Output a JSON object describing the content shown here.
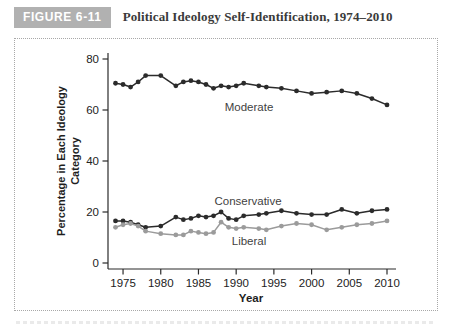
{
  "figure": {
    "badge": "FIGURE 6-11",
    "title": "Political Ideology Self-Identification, 1974–2010"
  },
  "chart_data": {
    "type": "line",
    "title": "Political Ideology Self-Identification, 1974–2010",
    "xlabel": "Year",
    "ylabel": "Percentage in Each Ideology Category",
    "ylabel_line1": "Percentage in Each Ideology",
    "ylabel_line2": "Category",
    "x_ticks": [
      1975,
      1980,
      1985,
      1990,
      1995,
      2000,
      2005,
      2010
    ],
    "y_ticks": [
      0,
      20,
      40,
      60,
      80
    ],
    "xlim": [
      1973,
      2011.5
    ],
    "ylim": [
      -2.4,
      85
    ],
    "grid": false,
    "legend": "inline-labels",
    "x": [
      1974,
      1975,
      1976,
      1977,
      1978,
      1980,
      1982,
      1983,
      1984,
      1985,
      1986,
      1987,
      1988,
      1989,
      1990,
      1991,
      1993,
      1994,
      1996,
      1998,
      2000,
      2002,
      2004,
      2006,
      2008,
      2010
    ],
    "series": [
      {
        "name": "Moderate",
        "color": "#2b2b2b",
        "values": [
          70.5,
          70,
          69,
          71,
          73.5,
          73.5,
          69.5,
          71,
          71.5,
          71,
          70,
          68.5,
          69.5,
          69,
          69.5,
          70.5,
          69.5,
          69,
          68.5,
          67.5,
          66.5,
          67,
          67.5,
          66.5,
          64.5,
          62
        ],
        "label_x": 234,
        "label_y": 72
      },
      {
        "name": "Conservative",
        "color": "#2b2b2b",
        "values": [
          16.5,
          16.5,
          16,
          15,
          14,
          14.5,
          18,
          17,
          17.5,
          18.5,
          18,
          18.5,
          20,
          17.5,
          17,
          18.5,
          19,
          19.5,
          20.5,
          19.5,
          19,
          19,
          21,
          19.5,
          20.5,
          21
        ],
        "label_x": 233,
        "label_y": 166
      },
      {
        "name": "Liberal",
        "color": "#9b9b9b",
        "values": [
          14,
          15,
          15.5,
          14.5,
          12.5,
          11.5,
          11,
          11,
          12.5,
          12,
          11.5,
          12,
          16,
          14,
          13.5,
          14,
          13.5,
          13,
          14.5,
          15.5,
          15,
          13,
          14,
          15,
          15.5,
          16.5
        ],
        "label_x": 234,
        "label_y": 206
      }
    ]
  }
}
